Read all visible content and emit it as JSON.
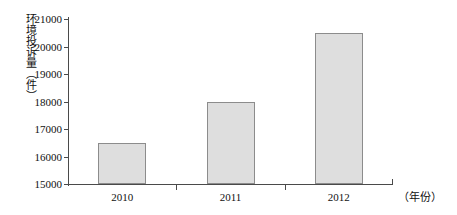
{
  "chart_data": {
    "type": "bar",
    "title": "",
    "subtitle": "",
    "xlabel": "（年份）",
    "ylabel": "环境投诉量（件）",
    "categories": [
      "2010",
      "2011",
      "2012"
    ],
    "values": [
      16500,
      17980,
      20500
    ],
    "series": [
      {
        "name": "环境投诉量",
        "values": [
          16500,
          17980,
          20500
        ]
      }
    ],
    "ylim": [
      15000,
      21000
    ],
    "ytick_labels": [
      "21000",
      "20000",
      "19000",
      "18000",
      "17000",
      "16000",
      "15000"
    ],
    "ytick_values": [
      21000,
      20000,
      19000,
      18000,
      17000,
      16000,
      15000
    ],
    "ytick_step": 1000,
    "grid": false,
    "legend": false,
    "legend_position": "none",
    "bar_fill_color": "#dedede",
    "bar_edge_color": "#8c8c8c",
    "axis_color": "#4a4a4a",
    "background_color": "#ffffff",
    "annotations": []
  }
}
